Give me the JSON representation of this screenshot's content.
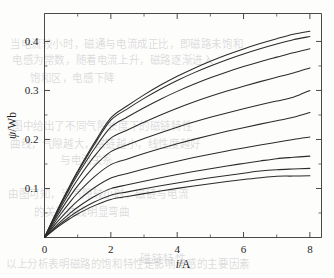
{
  "figure": {
    "background_color": "#fdfdfb",
    "line_color": "#2b2b2b",
    "axis_color": "#4a4a4a"
  },
  "chart_data": {
    "type": "line",
    "title": "",
    "subtitle": "",
    "xlabel": "i/A",
    "xlabel_symbol": "i",
    "xlabel_unit": "/A",
    "ylabel": "ψ/Wb",
    "ylabel_symbol": "ψ",
    "ylabel_unit": "/Wb",
    "xlim": [
      0,
      8.35
    ],
    "ylim": [
      0,
      0.457
    ],
    "xticks": [
      0,
      2,
      4,
      6,
      8
    ],
    "xticklabels": [
      "0",
      "2",
      "4",
      "6",
      "8"
    ],
    "xticks_minor": [
      1,
      3,
      5,
      7
    ],
    "yticks": [
      0,
      0.1,
      0.2,
      0.3,
      0.4
    ],
    "yticklabels": [
      "0",
      "0.1",
      "0.2",
      "0.3",
      "0.4"
    ],
    "yticks_minor": [
      0.05,
      0.15,
      0.25,
      0.35
    ],
    "grid": false,
    "legend": "none",
    "x": [
      0,
      0.25,
      0.5,
      0.75,
      1,
      1.5,
      2,
      2.5,
      3,
      3.5,
      4,
      4.5,
      5,
      5.5,
      6,
      6.5,
      7,
      7.5,
      8
    ],
    "series": [
      {
        "name": "curve-1",
        "end_value": 0.421,
        "values": [
          0,
          0.0365,
          0.0713,
          0.1043,
          0.1356,
          0.1932,
          0.244,
          0.2687,
          0.291,
          0.311,
          0.3289,
          0.345,
          0.3596,
          0.3728,
          0.3847,
          0.3956,
          0.4055,
          0.4146,
          0.421
        ]
      },
      {
        "name": "curve-2",
        "end_value": 0.41,
        "values": [
          0,
          0.0358,
          0.0699,
          0.1022,
          0.1329,
          0.1895,
          0.2393,
          0.2625,
          0.2838,
          0.303,
          0.3203,
          0.3359,
          0.35,
          0.3628,
          0.3744,
          0.385,
          0.3946,
          0.4034,
          0.41
        ]
      },
      {
        "name": "curve-3",
        "end_value": 0.385,
        "values": [
          0,
          0.0345,
          0.0674,
          0.0985,
          0.1279,
          0.1806,
          0.2253,
          0.2458,
          0.2648,
          0.2822,
          0.2981,
          0.3125,
          0.3257,
          0.3377,
          0.3487,
          0.3588,
          0.368,
          0.377,
          0.385
        ]
      },
      {
        "name": "curve-4",
        "end_value": 0.346,
        "values": [
          0,
          0.0322,
          0.0627,
          0.0915,
          0.1184,
          0.1654,
          0.2027,
          0.2192,
          0.235,
          0.2498,
          0.2636,
          0.2763,
          0.288,
          0.2988,
          0.3087,
          0.318,
          0.3268,
          0.3355,
          0.346
        ]
      },
      {
        "name": "curve-5",
        "end_value": 0.3,
        "values": [
          0,
          0.029,
          0.0563,
          0.0818,
          0.1053,
          0.145,
          0.1752,
          0.189,
          0.2019,
          0.2139,
          0.2251,
          0.2355,
          0.2452,
          0.2542,
          0.2627,
          0.2707,
          0.2784,
          0.2862,
          0.3
        ]
      },
      {
        "name": "curve-6",
        "end_value": 0.255,
        "values": [
          0,
          0.0253,
          0.0489,
          0.0708,
          0.0908,
          0.1238,
          0.1487,
          0.1604,
          0.1714,
          0.1816,
          0.1912,
          0.2002,
          0.2086,
          0.2166,
          0.2241,
          0.2313,
          0.2382,
          0.2452,
          0.255
        ]
      },
      {
        "name": "curve-7",
        "end_value": 0.205,
        "values": [
          0,
          0.0211,
          0.0405,
          0.0585,
          0.0748,
          0.1014,
          0.1213,
          0.1307,
          0.1396,
          0.1479,
          0.1557,
          0.1631,
          0.17,
          0.1766,
          0.1828,
          0.1887,
          0.1944,
          0.2,
          0.205
        ]
      },
      {
        "name": "curve-8",
        "end_value": 0.166,
        "values": [
          0,
          0.0175,
          0.0336,
          0.0484,
          0.0618,
          0.0835,
          0.0997,
          0.1075,
          0.1149,
          0.1219,
          0.1284,
          0.1346,
          0.1404,
          0.1459,
          0.1511,
          0.1561,
          0.1608,
          0.1636,
          0.166
        ]
      },
      {
        "name": "curve-9",
        "end_value": 0.141,
        "values": [
          0,
          0.0152,
          0.0291,
          0.0419,
          0.0535,
          0.0723,
          0.0863,
          0.0931,
          0.0995,
          0.1056,
          0.1113,
          0.1167,
          0.1218,
          0.1266,
          0.1312,
          0.1355,
          0.1383,
          0.1398,
          0.141
        ]
      },
      {
        "name": "curve-10",
        "end_value": 0.126,
        "values": [
          0,
          0.0137,
          0.0262,
          0.0377,
          0.0481,
          0.065,
          0.0776,
          0.0837,
          0.0895,
          0.095,
          0.1002,
          0.1051,
          0.1097,
          0.1141,
          0.1182,
          0.1221,
          0.125,
          0.1253,
          0.126
        ]
      }
    ]
  },
  "bleed_text": {
    "l1": "当电流较小时，磁通与电流成正比，即磁路未饱和",
    "l2": "电感为常数，随着电流上升，磁路逐渐进入",
    "l3": "饱和区，电感下降",
    "l4": "图中给出了不同气隙长度下的磁链特性",
    "l5": "曲线，气隙越大，磁链越小，线性度越好",
    "l6": "与电流关系",
    "l7": "由图可知，当气隙较小时，磁链与电流",
    "l8": "的关系曲线明显弯曲",
    "l9": "以上分析表明磁路的饱和特性是影响电感的主要因素",
    "l10": "磁链特性"
  }
}
